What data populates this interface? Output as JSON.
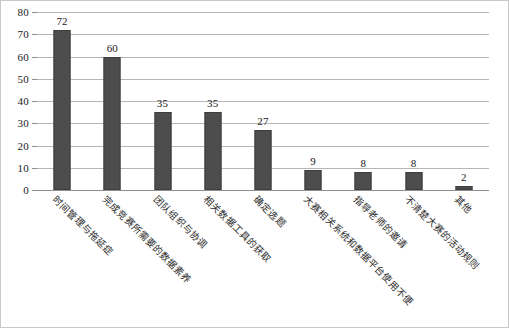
{
  "chart_data": {
    "type": "bar",
    "title": "",
    "subtitle": "",
    "xlabel": "",
    "ylabel": "",
    "ylim": [
      0,
      80
    ],
    "ytick_step": 10,
    "yticks": [
      0,
      10,
      20,
      30,
      40,
      50,
      60,
      70,
      80
    ],
    "ytick_labels": [
      "0",
      "10",
      "20",
      "30",
      "40",
      "50",
      "60",
      "70",
      "80"
    ],
    "grid": true,
    "legend": false,
    "legend_position": "none",
    "orientation": "vertical",
    "bar_color": "#4d4d4d",
    "bar_edge_color": "#3d3d3d",
    "gridline_color": "#b6b6b6",
    "categories": [
      "时间管理与拖延症",
      "完成竞赛所需要的数据素养",
      "团队组织与协调",
      "相关数据工具的获取",
      "确定选题",
      "大赛相关系统和数据平台使用不便",
      "指导老师的邀请",
      "不清楚大赛的活动规则",
      "其他"
    ],
    "values": [
      72,
      60,
      35,
      35,
      27,
      9,
      8,
      8,
      2
    ],
    "value_labels": [
      "72",
      "60",
      "35",
      "35",
      "27",
      "9",
      "8",
      "8",
      "2"
    ]
  }
}
